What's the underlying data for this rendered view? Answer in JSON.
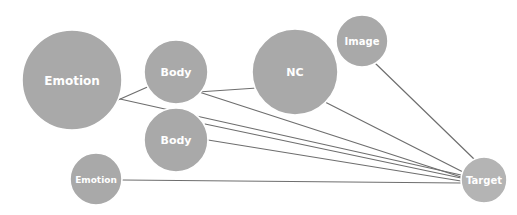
{
  "diagram": {
    "type": "network-graph",
    "background": "#ffffff",
    "width": 517,
    "height": 215,
    "node_fill": "#a9a9a9",
    "node_fill_target": "#b4b4b4",
    "node_stroke": "#ffffff",
    "label_color": "#ffffff",
    "edge_color": "#6e6e6e",
    "edge_width": 1.2,
    "nodes": [
      {
        "id": "emotion-large",
        "label": "Emotion",
        "cx": 72,
        "cy": 80,
        "r": 50,
        "font_size": 12,
        "fill": "#a9a9a9"
      },
      {
        "id": "body-upper",
        "label": "Body",
        "cx": 176,
        "cy": 72,
        "r": 32,
        "font_size": 11,
        "fill": "#a9a9a9"
      },
      {
        "id": "nc",
        "label": "NC",
        "cx": 295,
        "cy": 72,
        "r": 43,
        "font_size": 11,
        "fill": "#a9a9a9"
      },
      {
        "id": "image",
        "label": "Image",
        "cx": 362,
        "cy": 41,
        "r": 26,
        "font_size": 10,
        "fill": "#a9a9a9"
      },
      {
        "id": "body-lower",
        "label": "Body",
        "cx": 176,
        "cy": 140,
        "r": 32,
        "font_size": 11,
        "fill": "#a9a9a9"
      },
      {
        "id": "emotion-small",
        "label": "Emotion",
        "cx": 96,
        "cy": 179,
        "r": 26,
        "font_size": 9,
        "fill": "#a9a9a9"
      },
      {
        "id": "target",
        "label": "Target",
        "cx": 484,
        "cy": 180,
        "r": 23,
        "font_size": 10,
        "fill": "#b4b4b4"
      }
    ],
    "edges": [
      {
        "id": "edge-emotion-large-body-upper",
        "source": "emotion-large",
        "target": "body-upper",
        "x1": 118,
        "y1": 100,
        "x2": 152,
        "y2": 85
      },
      {
        "id": "edge-body-upper-nc",
        "source": "body-upper",
        "target": "nc",
        "x1": 198,
        "y1": 92,
        "x2": 257,
        "y2": 88
      },
      {
        "id": "edge-image-target",
        "source": "image",
        "target": "target",
        "x1": 375,
        "y1": 63,
        "x2": 474,
        "y2": 159
      },
      {
        "id": "edge-nc-target",
        "source": "nc",
        "target": "target",
        "x1": 325,
        "y1": 102,
        "x2": 463,
        "y2": 172
      },
      {
        "id": "edge-emotion-large-target",
        "source": "emotion-large",
        "target": "target",
        "x1": 120,
        "y1": 99,
        "x2": 461,
        "y2": 175
      },
      {
        "id": "edge-body-upper-target",
        "source": "body-upper",
        "target": "target",
        "x1": 199,
        "y1": 92,
        "x2": 461,
        "y2": 177
      },
      {
        "id": "edge-body-lower-target-a",
        "source": "body-lower",
        "target": "target",
        "x1": 205,
        "y1": 124,
        "x2": 461,
        "y2": 178
      },
      {
        "id": "edge-body-lower-target-b",
        "source": "body-lower",
        "target": "target",
        "x1": 208,
        "y1": 140,
        "x2": 461,
        "y2": 181
      },
      {
        "id": "edge-emotion-small-target",
        "source": "emotion-small",
        "target": "target",
        "x1": 122,
        "y1": 180,
        "x2": 461,
        "y2": 183
      }
    ]
  }
}
